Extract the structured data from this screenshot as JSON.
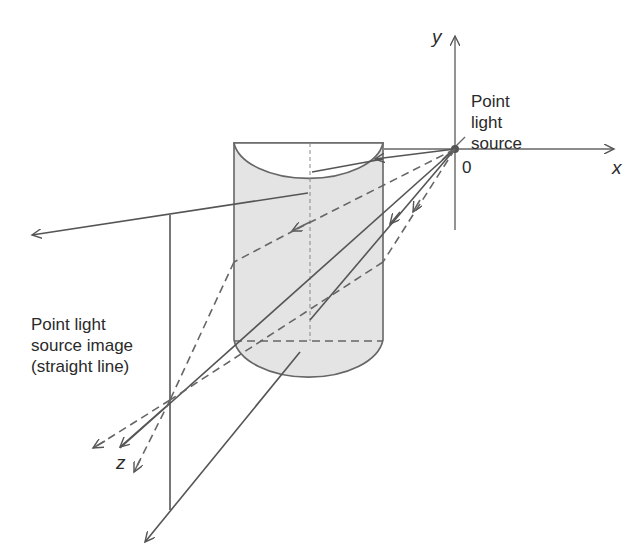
{
  "diagram": {
    "labels": {
      "point_light_source": [
        "Point",
        "light",
        "source"
      ],
      "point_light_source_image": [
        "Point light",
        "source image",
        "(straight line)"
      ],
      "origin": "0",
      "x_axis": "x",
      "y_axis": "y",
      "z_axis": "z"
    },
    "colors": {
      "line": "#555555",
      "cylinder_fill": "#e4e4e4",
      "text": "#2a2a2a"
    }
  }
}
